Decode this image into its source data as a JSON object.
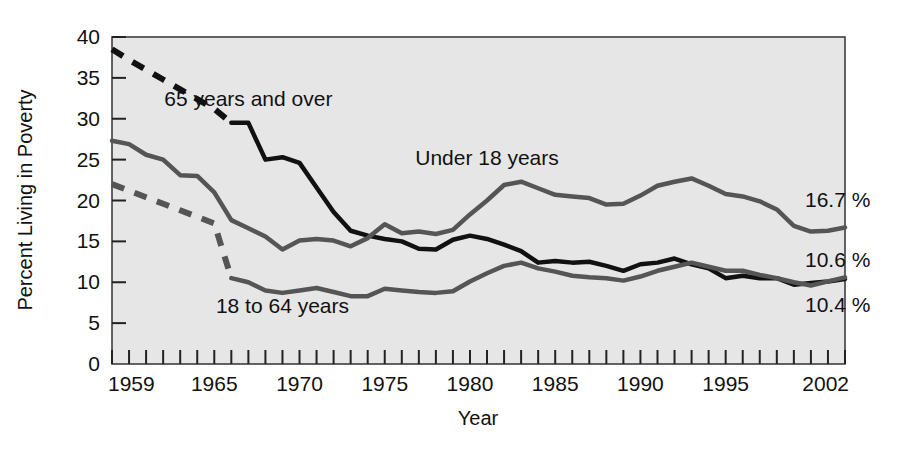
{
  "chart_data": {
    "type": "line",
    "title": "",
    "xlabel": "Year",
    "ylabel": "Percent Living in Poverty",
    "xlim": [
      1959,
      2002
    ],
    "ylim": [
      0,
      40
    ],
    "ytick_step": 5,
    "yticks": [
      "0",
      "5",
      "10",
      "15",
      "20",
      "25",
      "30",
      "35",
      "40"
    ],
    "xticks_labeled": [
      "1959",
      "1965",
      "1970",
      "1975",
      "1980",
      "1985",
      "1990",
      "1995",
      "2002"
    ],
    "xtick_every": 1,
    "grid": false,
    "legend": "inline-annotations",
    "plot_background": "#e6e6e6",
    "series": [
      {
        "name": "65 years and over",
        "color": "#111111",
        "label": "65 years and over",
        "label_x": 1967,
        "label_y": 31.5,
        "end_label": "10.4 %",
        "dashed_through": 1966,
        "x": [
          1959,
          1960,
          1961,
          1962,
          1963,
          1964,
          1965,
          1966,
          1967,
          1968,
          1969,
          1970,
          1971,
          1972,
          1973,
          1974,
          1975,
          1976,
          1977,
          1978,
          1979,
          1980,
          1981,
          1982,
          1983,
          1984,
          1985,
          1986,
          1987,
          1988,
          1989,
          1990,
          1991,
          1992,
          1993,
          1994,
          1995,
          1996,
          1997,
          1998,
          1999,
          2000,
          2001,
          2002
        ],
        "y": [
          38.5,
          37.2,
          36.0,
          34.8,
          33.6,
          32.4,
          31.2,
          29.5,
          29.5,
          25.0,
          25.3,
          24.6,
          21.6,
          18.6,
          16.3,
          15.7,
          15.3,
          15.0,
          14.1,
          14.0,
          15.2,
          15.7,
          15.3,
          14.6,
          13.8,
          12.4,
          12.6,
          12.4,
          12.5,
          12.0,
          11.4,
          12.2,
          12.4,
          12.9,
          12.2,
          11.7,
          10.5,
          10.8,
          10.5,
          10.5,
          9.7,
          9.9,
          10.1,
          10.4
        ]
      },
      {
        "name": "Under 18 years",
        "color": "#555555",
        "label": "Under 18 years",
        "label_x": 1981,
        "label_y": 24.3,
        "end_label": "16.7 %",
        "dashed_through": null,
        "x": [
          1959,
          1960,
          1961,
          1962,
          1963,
          1964,
          1965,
          1966,
          1967,
          1968,
          1969,
          1970,
          1971,
          1972,
          1973,
          1974,
          1975,
          1976,
          1977,
          1978,
          1979,
          1980,
          1981,
          1982,
          1983,
          1984,
          1985,
          1986,
          1987,
          1988,
          1989,
          1990,
          1991,
          1992,
          1993,
          1994,
          1995,
          1996,
          1997,
          1998,
          1999,
          2000,
          2001,
          2002
        ],
        "y": [
          27.3,
          26.9,
          25.6,
          25.0,
          23.1,
          23.0,
          21.0,
          17.6,
          16.6,
          15.6,
          14.0,
          15.1,
          15.3,
          15.1,
          14.4,
          15.4,
          17.1,
          16.0,
          16.2,
          15.9,
          16.4,
          18.3,
          20.0,
          21.9,
          22.3,
          21.5,
          20.7,
          20.5,
          20.3,
          19.5,
          19.6,
          20.6,
          21.8,
          22.3,
          22.7,
          21.8,
          20.8,
          20.5,
          19.9,
          18.9,
          16.9,
          16.2,
          16.3,
          16.7
        ]
      },
      {
        "name": "18 to 64 years",
        "color": "#555555",
        "label": "18 to 64 years",
        "label_x": 1969,
        "label_y": 6.2,
        "end_label": "10.6 %",
        "dashed_through": 1966,
        "x": [
          1959,
          1960,
          1961,
          1962,
          1963,
          1964,
          1965,
          1966,
          1967,
          1968,
          1969,
          1970,
          1971,
          1972,
          1973,
          1974,
          1975,
          1976,
          1977,
          1978,
          1979,
          1980,
          1981,
          1982,
          1983,
          1984,
          1985,
          1986,
          1987,
          1988,
          1989,
          1990,
          1991,
          1992,
          1993,
          1994,
          1995,
          1996,
          1997,
          1998,
          1999,
          2000,
          2001,
          2002
        ],
        "y": [
          22.0,
          21.2,
          20.4,
          19.6,
          18.8,
          18.0,
          17.2,
          10.5,
          10.0,
          9.0,
          8.7,
          9.0,
          9.3,
          8.8,
          8.3,
          8.3,
          9.2,
          9.0,
          8.8,
          8.7,
          8.9,
          10.1,
          11.1,
          12.0,
          12.4,
          11.7,
          11.3,
          10.8,
          10.6,
          10.5,
          10.2,
          10.7,
          11.4,
          11.9,
          12.4,
          11.9,
          11.4,
          11.4,
          10.9,
          10.5,
          10.0,
          9.6,
          10.1,
          10.6
        ]
      }
    ],
    "end_labels": [
      {
        "text": "16.7 %",
        "series": "Under 18 years",
        "x": 805,
        "y": 207
      },
      {
        "text": "10.6 %",
        "series": "18 to 64 years",
        "x": 805,
        "y": 267
      },
      {
        "text": "10.4 %",
        "series": "65 years and over",
        "x": 805,
        "y": 312
      }
    ]
  }
}
